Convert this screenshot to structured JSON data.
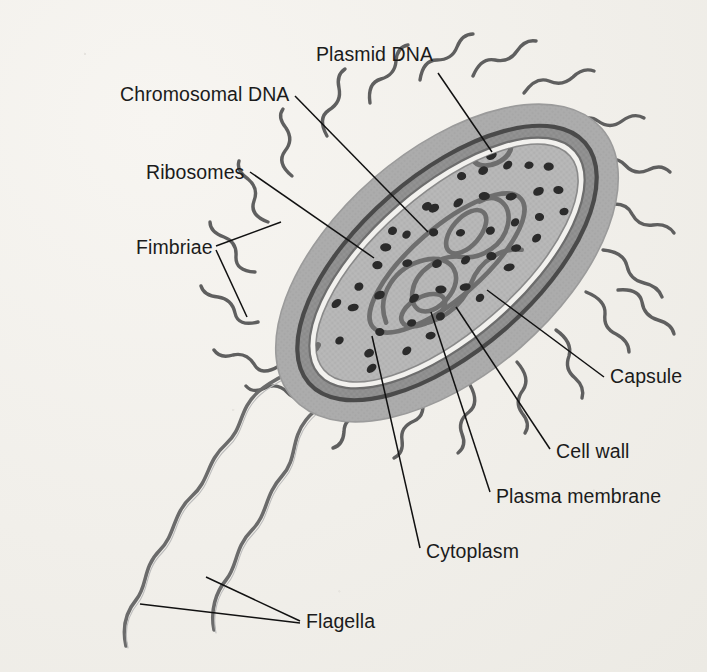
{
  "figure": {
    "background_color": "#f1efea"
  },
  "colors": {
    "capsule_fill": "#a9a9a9",
    "cell_wall_fill": "#8d8d8d",
    "cell_wall_stroke": "#4a4a4a",
    "plasma_membrane_fill": "#f2f1ee",
    "cytoplasm_fill": "#b4b4b4",
    "ribosome_fill": "#2b2b2b",
    "dna_stroke": "#6e6e6e",
    "flagella_stroke": "#6b6b6b",
    "fimbriae_stroke": "#5f5f5f",
    "leader_line": "#111111",
    "label_text": "#1b1b1b"
  },
  "labels": [
    {
      "id": "plasmid-dna",
      "text": "Plasmid DNA",
      "x": 316,
      "y": 45,
      "anchor": "left"
    },
    {
      "id": "chromosomal-dna",
      "text": "Chromosomal DNA",
      "x": 120,
      "y": 85,
      "anchor": "left"
    },
    {
      "id": "ribosomes",
      "text": "Ribosomes",
      "x": 146,
      "y": 163,
      "anchor": "left"
    },
    {
      "id": "fimbriae",
      "text": "Fimbriae",
      "x": 136,
      "y": 238,
      "anchor": "left"
    },
    {
      "id": "capsule",
      "text": "Capsule",
      "x": 610,
      "y": 367,
      "anchor": "left"
    },
    {
      "id": "cell-wall",
      "text": "Cell wall",
      "x": 556,
      "y": 442,
      "anchor": "left"
    },
    {
      "id": "plasma-membrane",
      "text": "Plasma membrane",
      "x": 496,
      "y": 487,
      "anchor": "left"
    },
    {
      "id": "cytoplasm",
      "text": "Cytoplasm",
      "x": 426,
      "y": 542,
      "anchor": "left"
    },
    {
      "id": "flagella",
      "text": "Flagella",
      "x": 306,
      "y": 612,
      "anchor": "left"
    }
  ],
  "leader_lines": [
    {
      "id": "plasmid-dna-leader",
      "label": "Plasmid DNA",
      "points": "438,73 492,152"
    },
    {
      "id": "chromosomal-dna-leader",
      "label": "Chromosomal DNA",
      "points": "295,96 428,232"
    },
    {
      "id": "ribosomes-leader",
      "label": "Ribosomes",
      "points": "250,172 374,258"
    },
    {
      "id": "fimbriae-leader-a",
      "label": "Fimbriae",
      "points": "216,246 281,222"
    },
    {
      "id": "fimbriae-leader-b",
      "label": "Fimbriae",
      "points": "216,250 247,317"
    },
    {
      "id": "capsule-leader",
      "label": "Capsule",
      "points": "604,377 487,290"
    },
    {
      "id": "cell-wall-leader",
      "label": "Cell wall",
      "points": "550,449 456,307"
    },
    {
      "id": "plasma-membrane-leader",
      "label": "Plasma membrane",
      "points": "490,492 431,312"
    },
    {
      "id": "cytoplasm-leader",
      "label": "Cytoplasm",
      "points": "420,548 372,336"
    },
    {
      "id": "flagella-leader-a",
      "label": "Flagella",
      "points": "300,621 206,577"
    },
    {
      "id": "flagella-leader-b",
      "label": "Flagella",
      "points": "300,623 140,604"
    }
  ],
  "cell": {
    "center_x": 447,
    "center_y": 263,
    "rotation_deg": -41,
    "capsule_rx": 205,
    "capsule_ry": 112,
    "cell_wall_rx": 183,
    "cell_wall_ry": 88,
    "plasma_membrane_rx": 170,
    "plasma_membrane_ry": 76,
    "cytoplasm_rx": 163,
    "cytoplasm_ry": 69
  },
  "structures": {
    "ribosome_count": 46,
    "fimbriae_count": 22,
    "flagella_count": 2,
    "plasmid_count": 1,
    "chromosomal_dna_note": "single coiled nucleoid loop"
  },
  "ribosomes": [
    [
      -132,
      -12
    ],
    [
      -118,
      17
    ],
    [
      -100,
      -28
    ],
    [
      -96,
      8
    ],
    [
      -88,
      40
    ],
    [
      -72,
      -20
    ],
    [
      -66,
      22
    ],
    [
      -54,
      -44
    ],
    [
      -48,
      5
    ],
    [
      -40,
      36
    ],
    [
      -30,
      -26
    ],
    [
      -22,
      16
    ],
    [
      -12,
      -48
    ],
    [
      -8,
      -6
    ],
    [
      -2,
      30
    ],
    [
      10,
      -32
    ],
    [
      16,
      10
    ],
    [
      26,
      -50
    ],
    [
      30,
      -14
    ],
    [
      38,
      24
    ],
    [
      48,
      -38
    ],
    [
      54,
      4
    ],
    [
      62,
      34
    ],
    [
      72,
      -26
    ],
    [
      78,
      14
    ],
    [
      88,
      -46
    ],
    [
      92,
      -8
    ],
    [
      100,
      26
    ],
    [
      110,
      -34
    ],
    [
      116,
      6
    ],
    [
      126,
      -20
    ],
    [
      132,
      18
    ],
    [
      -126,
      30
    ],
    [
      -82,
      -40
    ],
    [
      -60,
      44
    ],
    [
      -36,
      -52
    ],
    [
      2,
      48
    ],
    [
      22,
      -56
    ],
    [
      44,
      44
    ],
    [
      68,
      -56
    ],
    [
      84,
      40
    ],
    [
      104,
      -52
    ],
    [
      122,
      38
    ],
    [
      140,
      -6
    ],
    [
      -110,
      -42
    ],
    [
      -20,
      -60
    ]
  ],
  "credits": {}
}
